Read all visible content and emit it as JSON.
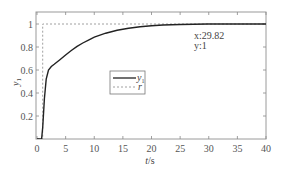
{
  "chart_data": {
    "type": "line",
    "title": "",
    "xlabel": "t/s",
    "xlabel_var": "t",
    "xlabel_unit": "/s",
    "ylabel": "y1",
    "ylabel_var": "y",
    "ylabel_sub": "1",
    "xlim": [
      0,
      40
    ],
    "ylim": [
      0,
      1.05
    ],
    "grid": false,
    "x_ticks": [
      0,
      5,
      10,
      15,
      20,
      25,
      30,
      35,
      40
    ],
    "x_tick_labels": [
      "0",
      "5",
      "10",
      "15",
      "20",
      "25",
      "30",
      "35",
      "40"
    ],
    "y_ticks": [
      0.2,
      0.4,
      0.6,
      0.8,
      1
    ],
    "y_tick_labels": [
      "0.2",
      "0.4",
      "0.6",
      "0.8",
      "1"
    ],
    "legend": {
      "position": "center",
      "entries": [
        {
          "label_var": "y",
          "label_sub": "1",
          "style": "solid"
        },
        {
          "label_var": "r",
          "label_sub": "",
          "style": "dashed"
        }
      ]
    },
    "series": [
      {
        "name": "y1",
        "style": "solid",
        "color": "#222222",
        "x": [
          0,
          0.8,
          1.0,
          1.3,
          1.6,
          2.0,
          2.5,
          3,
          4,
          5,
          6,
          7,
          8,
          9,
          10,
          12,
          14,
          16,
          18,
          20,
          22,
          25,
          29.82,
          35,
          40
        ],
        "y": [
          0,
          0,
          0.1,
          0.35,
          0.52,
          0.6,
          0.63,
          0.65,
          0.69,
          0.73,
          0.77,
          0.805,
          0.835,
          0.86,
          0.885,
          0.92,
          0.945,
          0.963,
          0.976,
          0.985,
          0.991,
          0.996,
          1,
          1,
          1
        ]
      },
      {
        "name": "r",
        "style": "dashed",
        "color": "#888888",
        "x": [
          0,
          1,
          1,
          40
        ],
        "y": [
          0,
          0,
          1,
          1
        ]
      }
    ],
    "annotations": [
      {
        "text_x": "x:29.82",
        "text_y": "y:1",
        "at": [
          29.82,
          1
        ]
      }
    ]
  }
}
